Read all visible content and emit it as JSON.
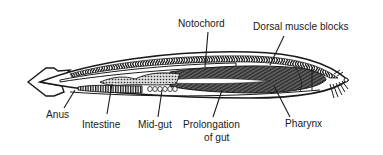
{
  "diagram": {
    "colors": {
      "ink": "#1a1a1a",
      "background": "#ffffff",
      "muscle_fill": "#555555",
      "pharynx_fill": "#4a4a4a"
    },
    "labels": {
      "notochord": "Notochord",
      "dorsal_muscle_blocks": "Dorsal muscle blocks",
      "anus": "Anus",
      "intestine": "Intestine",
      "mid_gut": "Mid-gut",
      "prolongation_line1": "Prolongation",
      "prolongation_line2": "of gut",
      "pharynx": "Pharynx"
    }
  }
}
